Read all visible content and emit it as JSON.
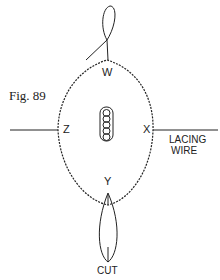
{
  "figure": {
    "caption": "Fig. 89"
  },
  "labels": {
    "top": "W",
    "left": "Z",
    "right": "X",
    "bottom": "Y",
    "wire_line1": "LACING",
    "wire_line2": "WIRE",
    "cut": "CUT"
  },
  "colors": {
    "ink": "#222222",
    "background": "#ffffff"
  }
}
